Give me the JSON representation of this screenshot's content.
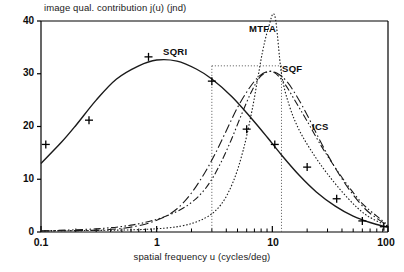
{
  "chart_data": {
    "type": "line",
    "title": "",
    "ylabel": "image qual. contribution j(u)  (jnd)",
    "xlabel": "spatial frequency u (cycles/deg)",
    "xscale": "log",
    "xlim": [
      0.1,
      100
    ],
    "ylim": [
      0,
      40
    ],
    "grid": false,
    "legend_position": "inline-annotations",
    "yticks": [
      "0",
      "10",
      "20",
      "30",
      "40"
    ],
    "ytick_values": [
      0,
      10,
      20,
      30,
      40
    ],
    "xticks": [
      "0.1",
      "1",
      "10",
      "100"
    ],
    "xtick_values": [
      0.1,
      1,
      10,
      100
    ],
    "series": [
      {
        "name": "SQRI",
        "style": "solid",
        "x": [
          0.1,
          0.15,
          0.2,
          0.3,
          0.45,
          0.7,
          1.0,
          1.5,
          2.2,
          3.0,
          4.5,
          6.5,
          9.0,
          12.0,
          17.0,
          24.0,
          35.0,
          50.0,
          70.0,
          100.0
        ],
        "y": [
          13.0,
          17.0,
          20.2,
          25.0,
          29.0,
          31.5,
          32.6,
          32.4,
          30.9,
          29.0,
          25.6,
          21.7,
          18.0,
          14.6,
          10.8,
          7.6,
          4.9,
          3.0,
          1.8,
          0.9
        ]
      },
      {
        "name": "SQRI-markers",
        "style": "markers",
        "marker": "plus",
        "x": [
          0.11,
          0.26,
          0.85,
          3.0,
          6.0,
          10.5,
          20.0,
          36.0,
          60.0,
          92.0
        ],
        "y": [
          16.6,
          21.2,
          33.2,
          28.6,
          19.5,
          16.6,
          12.3,
          6.3,
          2.1,
          1.0
        ]
      },
      {
        "name": "MTFA",
        "style": "dotted",
        "x": [
          0.1,
          0.3,
          0.8,
          1.6,
          2.6,
          3.6,
          4.6,
          5.6,
          6.6,
          7.4,
          8.2,
          9.2,
          10.5,
          12.0,
          14.0,
          17.0,
          22.0,
          30.0,
          45.0,
          65.0,
          100.0
        ],
        "y": [
          0.2,
          0.3,
          0.5,
          1.1,
          2.6,
          5.2,
          9.6,
          15.5,
          22.5,
          28.5,
          34.0,
          38.5,
          41.0,
          30.0,
          24.0,
          19.4,
          15.2,
          11.0,
          6.4,
          3.2,
          1.1
        ]
      },
      {
        "name": "SQF",
        "style": "dashdot",
        "x": [
          0.1,
          0.35,
          0.7,
          1.1,
          1.5,
          2.0,
          2.6,
          3.2,
          4.0,
          5.0,
          6.2,
          7.5,
          9.0,
          11.0,
          13.5,
          16.5,
          20.0,
          26.0,
          34.0,
          45.0,
          62.0,
          80.0,
          100.0
        ],
        "y": [
          0.2,
          0.4,
          1.2,
          2.6,
          4.4,
          7.4,
          11.2,
          14.8,
          19.2,
          23.6,
          27.0,
          29.3,
          30.4,
          30.1,
          28.4,
          25.5,
          22.2,
          17.2,
          12.6,
          8.4,
          4.6,
          2.6,
          1.2
        ]
      },
      {
        "name": "ICS",
        "style": "dash-dot-dot",
        "x": [
          0.1,
          0.3,
          0.6,
          1.0,
          1.5,
          2.0,
          2.5,
          3.0,
          3.6,
          4.4,
          5.4,
          6.6,
          8.0,
          10.0,
          12.5,
          16.0,
          20.0,
          26.0,
          34.0,
          45.0,
          60.0,
          80.0,
          100.0
        ],
        "y": [
          0.2,
          0.6,
          1.3,
          2.4,
          3.9,
          5.6,
          7.6,
          10.0,
          13.2,
          17.4,
          22.2,
          26.6,
          29.6,
          30.4,
          28.4,
          24.6,
          21.0,
          16.6,
          12.6,
          8.8,
          5.4,
          3.0,
          1.3
        ]
      }
    ],
    "annotations": [
      {
        "label": "SQRI",
        "x_px": 163,
        "y_px": 46
      },
      {
        "label": "MTFA",
        "x_px": 249,
        "y_px": 23
      },
      {
        "label": "SQF",
        "x_px": 282,
        "y_px": 63
      },
      {
        "label": "ICS",
        "x_px": 312,
        "y_px": 121
      }
    ],
    "reference_box": {
      "description": "dotted rectangle marking SQF passband",
      "x_left": 3.0,
      "x_right": 12.0,
      "y_top": 31.5,
      "y_bottom": 0
    }
  },
  "colors": {
    "axis": "#000000",
    "curve": "#1a1a1a",
    "background": "#ffffff"
  }
}
